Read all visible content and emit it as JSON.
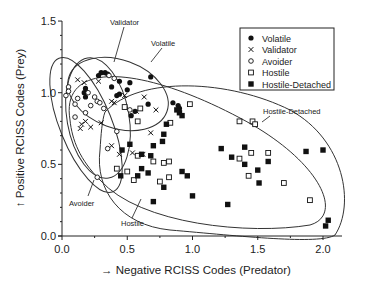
{
  "chart_data": {
    "type": "scatter",
    "title": "",
    "xlabel": "→ Negative RCISS Codes (Predator)",
    "ylabel": "↑ Positive RCISS Codes (Prey)",
    "xlim": [
      0.0,
      2.15
    ],
    "ylim": [
      0.0,
      1.5
    ],
    "x_ticks": [
      "0.0",
      "0.5",
      "1.0",
      "1.5",
      "2.0"
    ],
    "y_ticks": [
      "0.0",
      "0.5",
      "1.0",
      "1.5"
    ],
    "grid": false,
    "legend_position": "upper right",
    "series": [
      {
        "name": "Volatile",
        "marker": "filled-circle",
        "points": [
          [
            0.3,
            1.14
          ],
          [
            0.33,
            1.14
          ],
          [
            0.35,
            1.13
          ],
          [
            0.28,
            1.12
          ],
          [
            0.18,
            1.03
          ],
          [
            0.17,
            1.0
          ],
          [
            0.18,
            0.97
          ],
          [
            0.44,
            1.08
          ],
          [
            0.52,
            1.07
          ],
          [
            0.68,
            1.11
          ],
          [
            0.38,
            1.04
          ],
          [
            0.42,
            0.98
          ],
          [
            0.44,
            0.99
          ],
          [
            0.5,
            1.02
          ],
          [
            0.66,
            0.92
          ],
          [
            0.56,
            0.87
          ],
          [
            0.53,
            0.84
          ],
          [
            0.85,
            0.93
          ],
          [
            0.89,
            0.91
          ],
          [
            0.9,
            0.89
          ]
        ]
      },
      {
        "name": "Validator",
        "marker": "x",
        "points": [
          [
            0.12,
            1.09
          ],
          [
            0.17,
            1.07
          ],
          [
            0.28,
            1.08
          ],
          [
            0.48,
            0.98
          ],
          [
            0.18,
            0.8
          ],
          [
            0.15,
            0.78
          ],
          [
            0.14,
            0.75
          ],
          [
            0.22,
            0.76
          ],
          [
            0.38,
            0.94
          ],
          [
            0.4,
            0.93
          ],
          [
            0.63,
            0.97
          ],
          [
            0.72,
            0.88
          ],
          [
            0.57,
            0.87
          ],
          [
            0.44,
            0.57
          ],
          [
            0.54,
            0.58
          ],
          [
            0.38,
            0.63
          ],
          [
            0.62,
            0.57
          ],
          [
            0.68,
            0.72
          ],
          [
            0.3,
            0.79
          ]
        ]
      },
      {
        "name": "Avoider",
        "marker": "open-circle",
        "points": [
          [
            0.05,
            1.04
          ],
          [
            0.05,
            1.01
          ],
          [
            0.03,
            0.98
          ],
          [
            0.12,
            0.96
          ],
          [
            0.2,
            1.0
          ],
          [
            0.25,
            0.97
          ],
          [
            0.27,
            0.94
          ],
          [
            0.29,
            0.93
          ],
          [
            0.1,
            0.92
          ],
          [
            0.22,
            0.91
          ],
          [
            0.32,
            0.89
          ],
          [
            0.1,
            0.83
          ],
          [
            0.52,
            0.88
          ],
          [
            0.36,
            1.12
          ],
          [
            0.4,
            1.1
          ],
          [
            0.42,
            0.73
          ],
          [
            0.35,
            0.61
          ],
          [
            0.27,
            0.41
          ],
          [
            0.18,
            0.86
          ]
        ]
      },
      {
        "name": "Hostile",
        "marker": "open-square",
        "points": [
          [
            0.48,
            0.9
          ],
          [
            0.98,
            0.92
          ],
          [
            0.6,
            0.89
          ],
          [
            0.58,
            0.8
          ],
          [
            0.83,
            0.79
          ],
          [
            0.42,
            0.47
          ],
          [
            0.5,
            0.45
          ],
          [
            0.58,
            0.56
          ],
          [
            0.78,
            0.51
          ],
          [
            0.82,
            0.52
          ],
          [
            0.82,
            0.41
          ],
          [
            0.7,
            0.52
          ],
          [
            0.75,
            0.38
          ],
          [
            0.55,
            0.39
          ],
          [
            1.36,
            0.8
          ],
          [
            1.46,
            0.8
          ],
          [
            1.48,
            0.78
          ],
          [
            1.45,
            0.58
          ],
          [
            1.58,
            0.58
          ],
          [
            1.36,
            0.54
          ],
          [
            1.43,
            0.42
          ],
          [
            1.7,
            0.37
          ],
          [
            1.9,
            0.25
          ]
        ]
      },
      {
        "name": "Hostile-Detached",
        "marker": "filled-square",
        "points": [
          [
            0.88,
            0.88
          ],
          [
            0.9,
            0.86
          ],
          [
            0.92,
            0.84
          ],
          [
            0.8,
            0.78
          ],
          [
            0.78,
            0.71
          ],
          [
            0.77,
            0.66
          ],
          [
            0.7,
            0.63
          ],
          [
            0.52,
            0.64
          ],
          [
            0.46,
            0.6
          ],
          [
            0.61,
            0.57
          ],
          [
            0.61,
            0.47
          ],
          [
            0.45,
            0.42
          ],
          [
            0.68,
            0.56
          ],
          [
            0.66,
            0.44
          ],
          [
            0.78,
            0.34
          ],
          [
            0.58,
            0.42
          ],
          [
            0.96,
            0.42
          ],
          [
            1.22,
            0.61
          ],
          [
            1.4,
            0.62
          ],
          [
            1.3,
            0.55
          ],
          [
            1.4,
            0.5
          ],
          [
            1.58,
            0.52
          ],
          [
            1.87,
            0.59
          ],
          [
            2.0,
            0.6
          ],
          [
            1.5,
            0.46
          ],
          [
            1.51,
            0.37
          ],
          [
            1.27,
            0.22
          ],
          [
            2.02,
            0.07
          ],
          [
            2.04,
            0.11
          ],
          [
            0.92,
            0.45
          ],
          [
            0.7,
            0.24
          ],
          [
            1.0,
            0.28
          ]
        ]
      }
    ],
    "ellipse_labels": [
      "Validator",
      "Volatile",
      "Hostile-Detached",
      "Avoider",
      "Hostile"
    ]
  },
  "legend": {
    "items": [
      {
        "label": "Volatile",
        "marker": "filled-circle"
      },
      {
        "label": "Validator",
        "marker": "x"
      },
      {
        "label": "Avoider",
        "marker": "open-circle"
      },
      {
        "label": "Hostile",
        "marker": "open-square"
      },
      {
        "label": "Hostile-Detached",
        "marker": "filled-square"
      }
    ]
  },
  "annotations": {
    "validator": "Validator",
    "volatile": "Volatile",
    "hostile_detached": "Hostile-Detached",
    "avoider": "Avoider",
    "hostile": "Hostile"
  },
  "colors": {
    "ink": "#222222",
    "background": "#ffffff"
  }
}
